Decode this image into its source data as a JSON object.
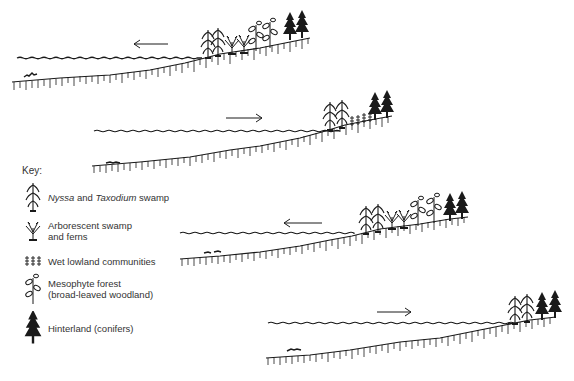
{
  "figure": {
    "panels": [
      {
        "id": 1,
        "arrow_direction": "left",
        "vegetation": [
          "nyssa-taxodium",
          "arborescent",
          "mesophyte",
          "conifer"
        ]
      },
      {
        "id": 2,
        "arrow_direction": "right",
        "vegetation": [
          "nyssa-taxodium",
          "wet-lowland",
          "conifer"
        ]
      },
      {
        "id": 3,
        "arrow_direction": "left",
        "vegetation": [
          "nyssa-taxodium",
          "arborescent",
          "mesophyte",
          "conifer"
        ]
      },
      {
        "id": 4,
        "arrow_direction": "right",
        "vegetation": [
          "nyssa-taxodium",
          "conifer"
        ]
      }
    ]
  },
  "key": {
    "title": "Key:",
    "items": [
      {
        "icon": "nyssa-taxodium-icon",
        "label_italic_1": "Nyssa",
        "label_mid": " and ",
        "label_italic_2": "Taxodium",
        "label_end": " swamp"
      },
      {
        "icon": "arborescent-icon",
        "label_line1": "Arborescent swamp",
        "label_line2": "and ferns"
      },
      {
        "icon": "wet-lowland-icon",
        "label": "Wet lowland communities"
      },
      {
        "icon": "mesophyte-icon",
        "label_line1": "Mesophyte forest",
        "label_line2": "(broad-leaved woodland)"
      },
      {
        "icon": "conifer-icon",
        "label": "Hinterland (conifers)"
      }
    ]
  },
  "colors": {
    "ink": "#1a1a1a",
    "background": "#ffffff"
  }
}
